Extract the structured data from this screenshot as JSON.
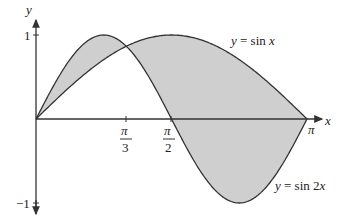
{
  "chart_data": {
    "type": "line",
    "title": "",
    "xlabel": "x",
    "ylabel": "y",
    "xlim": [
      0,
      3.14159
    ],
    "ylim": [
      -1,
      1
    ],
    "grid": false,
    "x_ticks": [
      {
        "value": 1.0472,
        "num": "π",
        "den": "3"
      },
      {
        "value": 1.5708,
        "num": "π",
        "den": "2"
      },
      {
        "value": 3.14159,
        "label": "π"
      }
    ],
    "y_ticks": [
      {
        "value": 1,
        "label": "1"
      },
      {
        "value": -1,
        "label": "−1"
      }
    ],
    "series": [
      {
        "name": "y = sin x",
        "function": "sin(x)",
        "x": [
          0,
          0.5236,
          1.0472,
          1.5708,
          2.0944,
          2.618,
          3.14159
        ],
        "values": [
          0,
          0.5,
          0.866,
          1,
          0.866,
          0.5,
          0
        ]
      },
      {
        "name": "y = sin 2x",
        "function": "sin(2x)",
        "x": [
          0,
          0.5236,
          0.7854,
          1.0472,
          1.5708,
          2.0944,
          2.3562,
          2.618,
          3.14159
        ],
        "values": [
          0,
          0.866,
          1,
          0.866,
          0,
          -0.866,
          -1,
          -0.866,
          0
        ]
      }
    ],
    "shaded_region": "area between y = sin x and y = sin 2x on [0, π]",
    "annotations": [
      "y = sin x",
      "y = sin 2x"
    ],
    "intersection": {
      "x": 1.0472,
      "label": "π/3"
    }
  },
  "labels": {
    "y_axis": "y",
    "x_axis": "x",
    "y_one": "1",
    "y_neg_one": "−1",
    "pi": "π",
    "pi3_num": "π",
    "pi3_den": "3",
    "pi2_num": "π",
    "pi2_den": "2",
    "sinx": "y = sin x",
    "sin2x": "y = sin 2x"
  }
}
